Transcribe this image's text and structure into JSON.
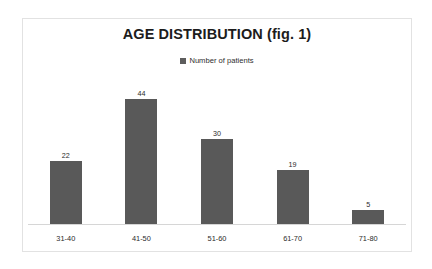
{
  "chart_data": {
    "type": "bar",
    "title": "AGE DISTRIBUTION (fig. 1)",
    "xlabel": "",
    "ylabel": "",
    "categories": [
      "31-40",
      "41-50",
      "51-60",
      "61-70",
      "71-80"
    ],
    "values": [
      22,
      44,
      30,
      19,
      5
    ],
    "series": [
      {
        "name": "Number of patients",
        "values": [
          22,
          44,
          30,
          19,
          5
        ]
      }
    ],
    "ylim": [
      0,
      44
    ],
    "grid": false,
    "legend": {
      "position": "top-center",
      "entries": [
        {
          "label": "Number of patients",
          "color": "#595959"
        }
      ]
    },
    "data_labels_shown": true,
    "y_axis_visible": false,
    "x_axis_visible": true,
    "colors": {
      "bar": "#595959",
      "title_text": "#1c1c1c",
      "label_text": "#2b2b2b",
      "axis_line": "#d6d6d6",
      "frame_border": "#e2e2e2",
      "background": "#ffffff"
    }
  }
}
